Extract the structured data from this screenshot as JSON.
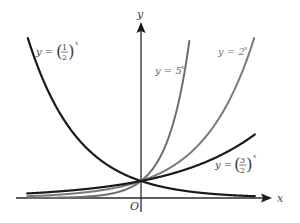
{
  "axes": {
    "x_label": "x",
    "y_label": "y",
    "origin_label": "O"
  },
  "scale": {
    "origin_px": [
      141,
      198
    ],
    "unit_x_px": 35,
    "unit_y_px": 17,
    "x_range": [
      -3.25,
      3.25
    ]
  },
  "curves": [
    {
      "id": "half",
      "base": 0.5,
      "label_prefix": "y = ",
      "label_base_num": "1",
      "label_base_den": "2",
      "label_exp": "x",
      "color": "#1a1a1a",
      "width": 2.2
    },
    {
      "id": "five",
      "base": 5,
      "label": "y = 5",
      "label_exp": "x",
      "color": "#6e6e6e",
      "width": 2.0
    },
    {
      "id": "two",
      "base": 2,
      "label": "y = 2",
      "label_exp": "x",
      "color": "#7a7a7a",
      "width": 2.0
    },
    {
      "id": "threehalves",
      "base": 1.5,
      "label_prefix": "y = ",
      "label_base_num": "3",
      "label_base_den": "2",
      "label_exp": "x",
      "color": "#1a1a1a",
      "width": 2.2
    }
  ],
  "colors": {
    "axis": "#2a2a2a",
    "label_text": "#555555",
    "background": "#ffffff"
  }
}
